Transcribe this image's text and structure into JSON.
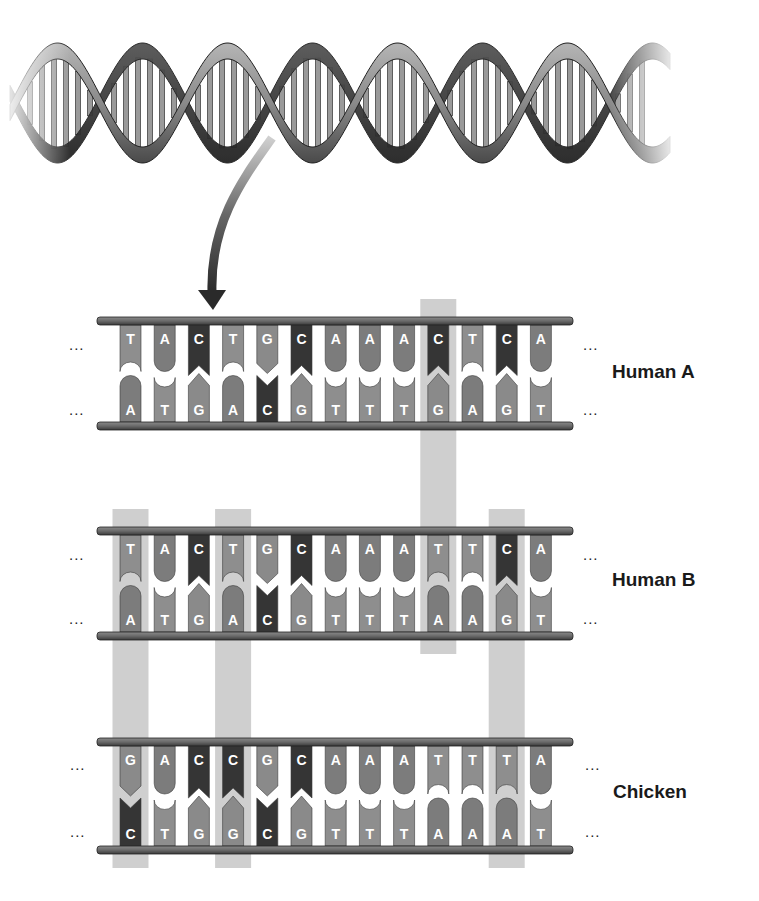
{
  "figure": {
    "helix": {
      "icon": "dna-double-helix-icon",
      "turns": 7
    },
    "arrow": {
      "icon": "curved-arrow-icon"
    },
    "ellipsis": "...",
    "colors": {
      "A": "#7c7c7c",
      "T": "#8e8e8e",
      "G": "#8a8a8a",
      "C": "#353535",
      "backbone": "#6f6f6f",
      "highlight": "#cfcfcf",
      "letter": "#ffffff"
    },
    "sequences": [
      {
        "label": "Human A",
        "top": [
          "T",
          "A",
          "C",
          "T",
          "G",
          "C",
          "A",
          "A",
          "A",
          "C",
          "T",
          "C",
          "A"
        ],
        "bottom": [
          "A",
          "T",
          "G",
          "A",
          "C",
          "G",
          "T",
          "T",
          "T",
          "G",
          "A",
          "G",
          "T"
        ]
      },
      {
        "label": "Human B",
        "top": [
          "T",
          "A",
          "C",
          "T",
          "G",
          "C",
          "A",
          "A",
          "A",
          "T",
          "T",
          "C",
          "A"
        ],
        "bottom": [
          "A",
          "T",
          "G",
          "A",
          "C",
          "G",
          "T",
          "T",
          "T",
          "A",
          "A",
          "G",
          "T"
        ]
      },
      {
        "label": "Chicken",
        "top": [
          "G",
          "A",
          "C",
          "C",
          "G",
          "C",
          "A",
          "A",
          "A",
          "T",
          "T",
          "T",
          "A"
        ],
        "bottom": [
          "C",
          "T",
          "G",
          "G",
          "C",
          "G",
          "T",
          "T",
          "T",
          "A",
          "A",
          "A",
          "T"
        ]
      }
    ],
    "highlights": [
      {
        "column": 10,
        "from_row": 0,
        "to_row": 1,
        "note": "Human A vs Human B difference"
      },
      {
        "column": 1,
        "from_row": 1,
        "to_row": 2,
        "note": "Human B vs Chicken difference"
      },
      {
        "column": 4,
        "from_row": 1,
        "to_row": 2,
        "note": "Human B vs Chicken difference"
      },
      {
        "column": 12,
        "from_row": 1,
        "to_row": 2,
        "note": "Human B vs Chicken difference"
      }
    ]
  }
}
